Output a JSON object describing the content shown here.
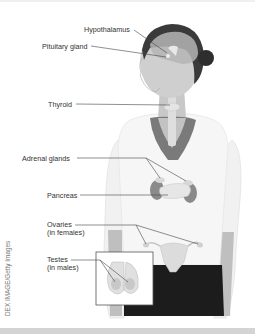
{
  "figure": {
    "labels": [
      {
        "id": "hypothalamus",
        "text": "Hypothalamus",
        "x": 84,
        "y": 26
      },
      {
        "id": "pituitary",
        "text": "Pituitary gland",
        "x": 42,
        "y": 43
      },
      {
        "id": "thyroid",
        "text": "Thyroid",
        "x": 48,
        "y": 101
      },
      {
        "id": "adrenal",
        "text": "Adrenal glands",
        "x": 22,
        "y": 155
      },
      {
        "id": "pancreas",
        "text": "Pancreas",
        "x": 47,
        "y": 192
      },
      {
        "id": "ovaries-1",
        "text": "Ovaries",
        "x": 47,
        "y": 222
      },
      {
        "id": "ovaries-2",
        "text": "(in females)",
        "x": 47,
        "y": 229
      },
      {
        "id": "testes-1",
        "text": "Testes",
        "x": 47,
        "y": 257
      },
      {
        "id": "testes-2",
        "text": "(in males)",
        "x": 47,
        "y": 264
      }
    ],
    "credit": "DEX IMAGE/Getty Images"
  },
  "colors": {
    "background": "#ffffff",
    "label_text": "#333333",
    "leader_line": "#444444",
    "shirt": "#f4f4f4",
    "skin": "#c9c9c9",
    "hair": "#3a3a3a",
    "pants": "#1a1a1a",
    "gland_dark": "#8a8a8a",
    "gland_light": "#e6e6e6",
    "bottom_band": "#d4d4d4"
  }
}
